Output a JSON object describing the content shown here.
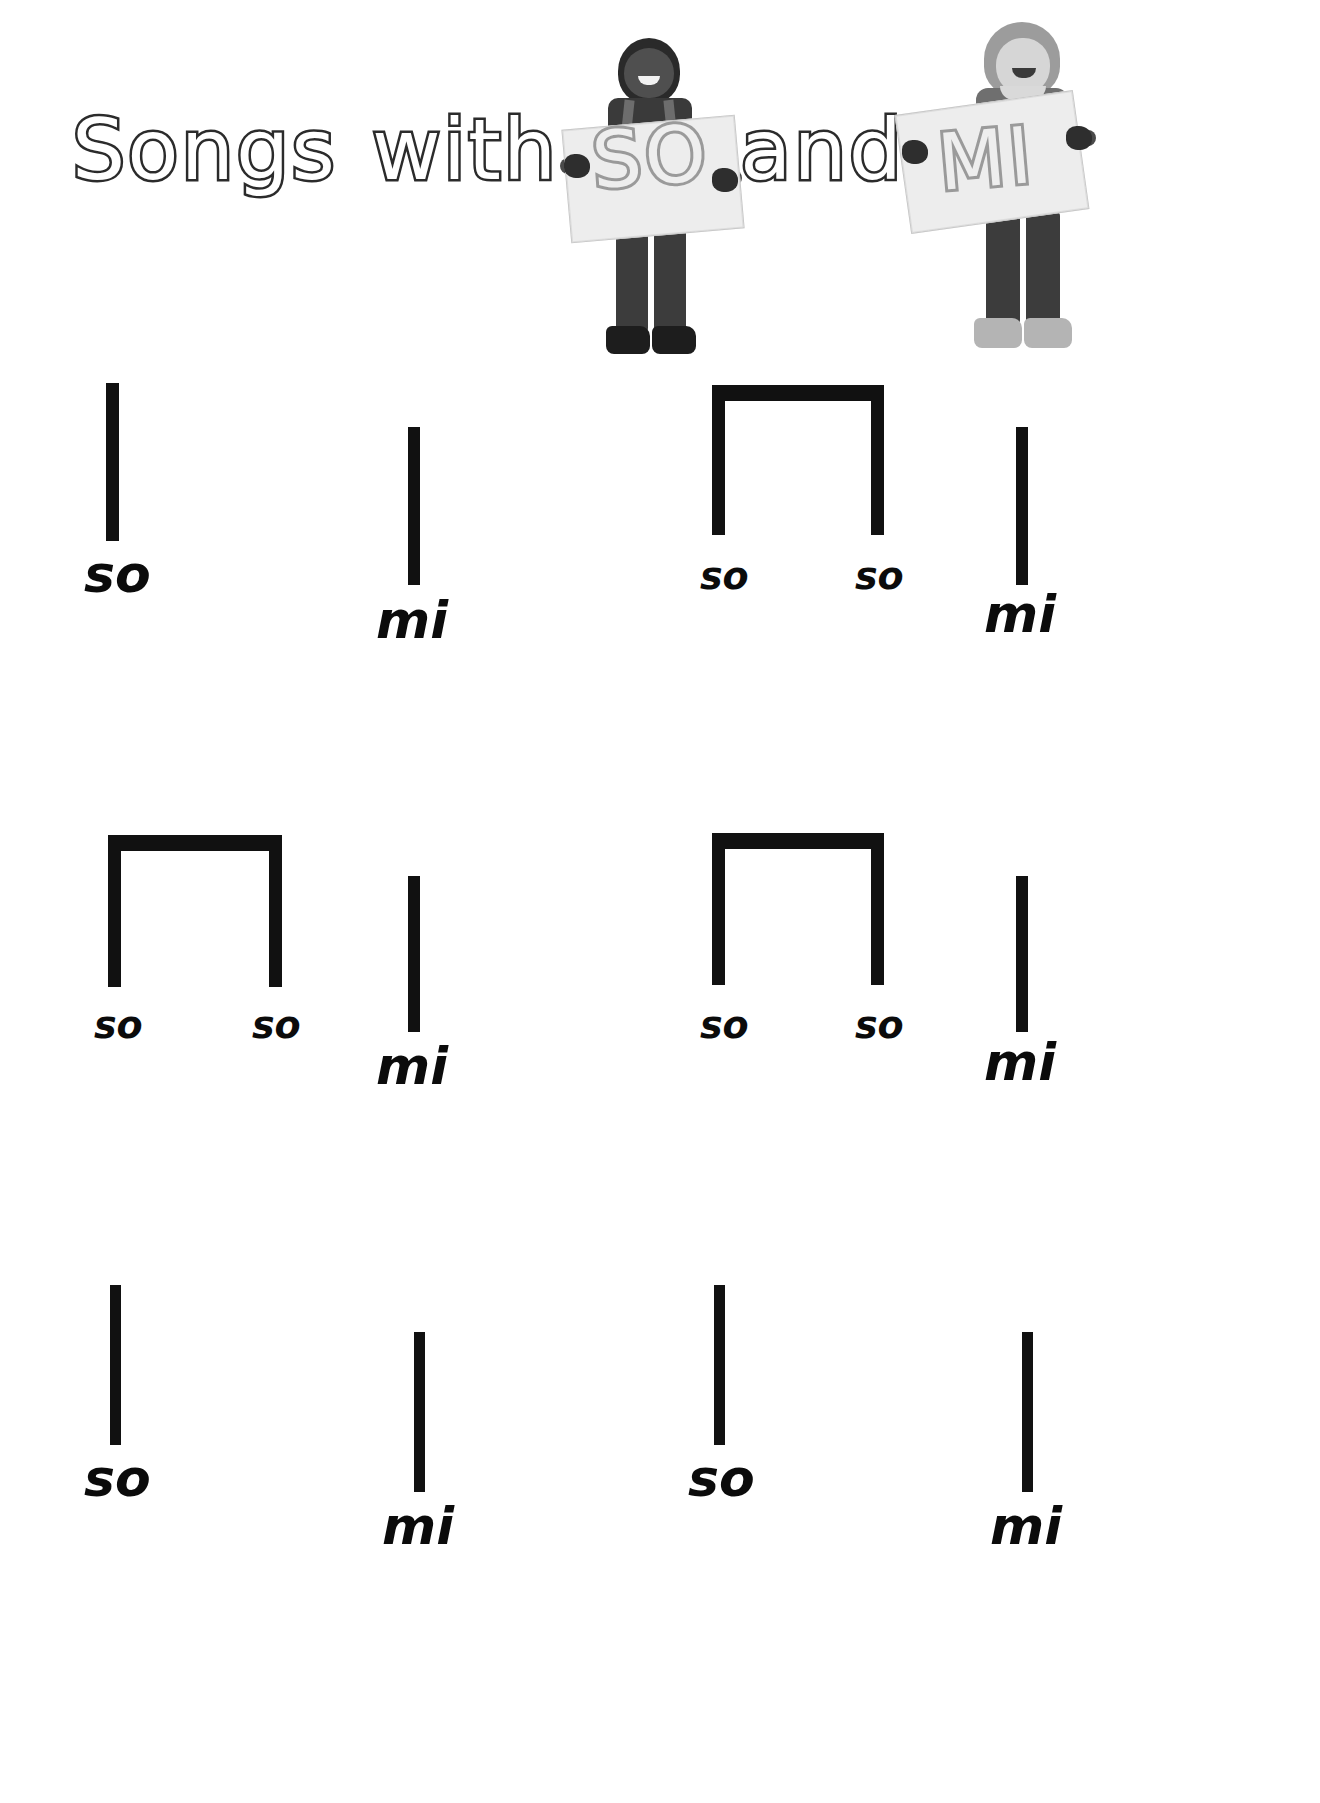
{
  "title": {
    "full_text": "Songs with SO and MI",
    "words": [
      {
        "id": "songs",
        "text": "Songs"
      },
      {
        "id": "with",
        "text": "with"
      },
      {
        "id": "and",
        "text": "and"
      }
    ],
    "sign_words": [
      {
        "id": "so",
        "text": "SO",
        "held_by": "boy"
      },
      {
        "id": "mi",
        "text": "MI",
        "held_by": "girl"
      }
    ],
    "outline_color": "#2b2b2b",
    "sign_text_color": "#9a9a9a",
    "fill_color": "#ffffff"
  },
  "photos": [
    {
      "name": "boy-holding-so-sign",
      "sign_label": "SO"
    },
    {
      "name": "girl-holding-mi-sign",
      "sign_label": "MI"
    }
  ],
  "notation": {
    "stem_color": "#111111",
    "syllable_so": "so",
    "syllable_mi": "mi",
    "rows": [
      {
        "row": 1,
        "groups": [
          {
            "type": "single",
            "pitch": "so",
            "labels": [
              "so"
            ]
          },
          {
            "type": "single",
            "pitch": "mi",
            "labels": [
              "mi"
            ]
          },
          {
            "type": "beamed-pair",
            "pitch": "so",
            "labels": [
              "so",
              "so"
            ]
          },
          {
            "type": "single",
            "pitch": "mi",
            "labels": [
              "mi"
            ]
          }
        ]
      },
      {
        "row": 2,
        "groups": [
          {
            "type": "beamed-pair",
            "pitch": "so",
            "labels": [
              "so",
              "so"
            ]
          },
          {
            "type": "single",
            "pitch": "mi",
            "labels": [
              "mi"
            ]
          },
          {
            "type": "beamed-pair",
            "pitch": "so",
            "labels": [
              "so",
              "so"
            ]
          },
          {
            "type": "single",
            "pitch": "mi",
            "labels": [
              "mi"
            ]
          }
        ]
      },
      {
        "row": 3,
        "groups": [
          {
            "type": "single",
            "pitch": "so",
            "labels": [
              "so"
            ]
          },
          {
            "type": "single",
            "pitch": "mi",
            "labels": [
              "mi"
            ]
          },
          {
            "type": "single",
            "pitch": "so",
            "labels": [
              "so"
            ]
          },
          {
            "type": "single",
            "pitch": "mi",
            "labels": [
              "mi"
            ]
          }
        ]
      }
    ]
  }
}
